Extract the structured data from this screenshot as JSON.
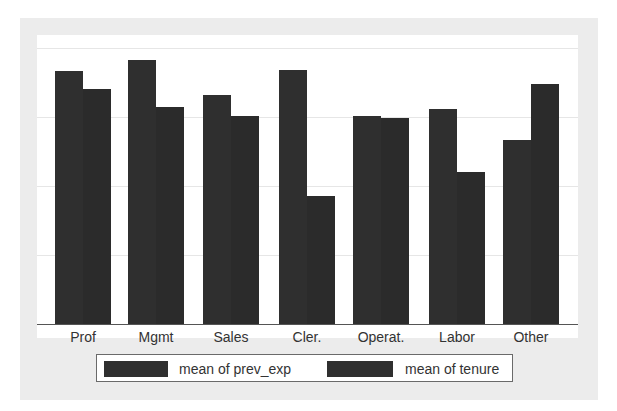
{
  "chart_data": {
    "type": "bar",
    "title": "",
    "xlabel": "",
    "ylabel": "",
    "categories": [
      "Prof",
      "Mgmt",
      "Sales",
      "Cler.",
      "Operat.",
      "Labor",
      "Other"
    ],
    "series": [
      {
        "name": "mean of prev_exp",
        "values": [
          18.3,
          19.1,
          16.6,
          18.4,
          15.1,
          15.6,
          13.3
        ]
      },
      {
        "name": "mean of tenure",
        "values": [
          17.0,
          15.7,
          15.1,
          9.3,
          14.9,
          11.0,
          17.4
        ]
      }
    ],
    "ylim": [
      0,
      20
    ],
    "y_axis_labels_shown": false,
    "grid": true,
    "legend_position": "bottom",
    "bar_color": "#2f2f2f"
  },
  "legend": {
    "items": [
      {
        "label": "mean of prev_exp"
      },
      {
        "label": "mean of tenure"
      }
    ]
  }
}
